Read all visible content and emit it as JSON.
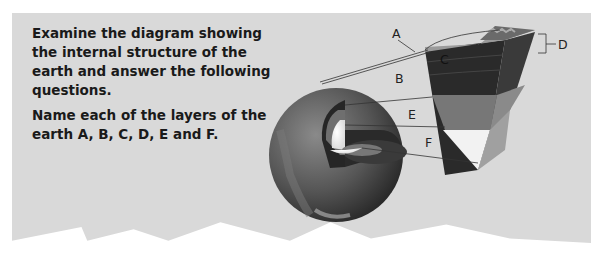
{
  "question": {
    "paragraph1": "Examine the diagram showing the internal structure of the earth and answer the following questions.",
    "paragraph2": "Name each of the layers of the earth A, B, C, D, E and F."
  },
  "diagram": {
    "title": "Internal structure of the earth",
    "labels": {
      "A": "A",
      "B": "B",
      "C": "C",
      "D": "D",
      "E": "E",
      "F": "F"
    },
    "colors": {
      "panel": "#d9d9d9",
      "crust": "#9a9a9a",
      "mantle": "#2e2e2e",
      "outer_core": "#7a7a7a",
      "inner_core": "#f2f2f2"
    }
  }
}
